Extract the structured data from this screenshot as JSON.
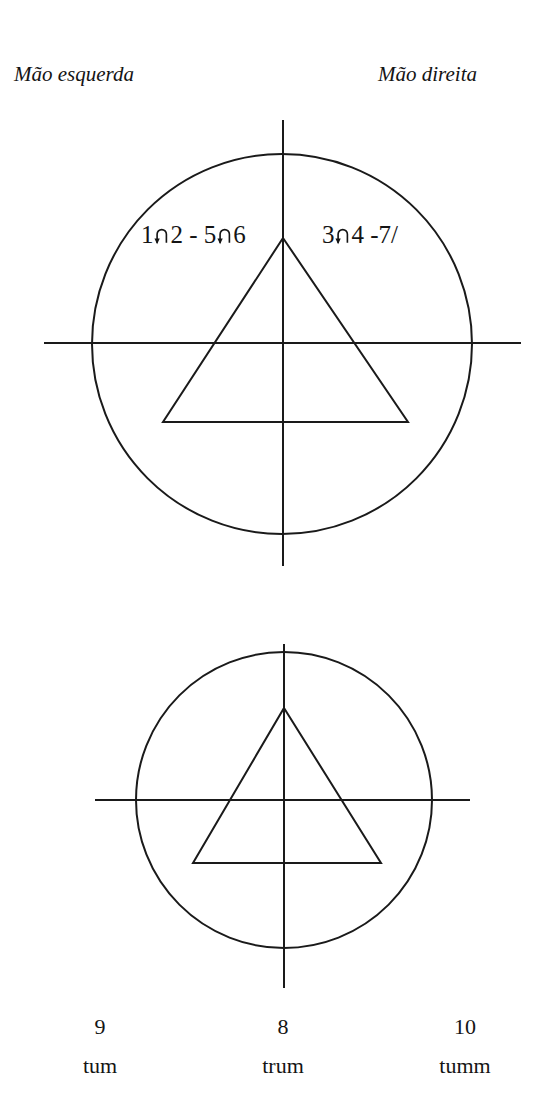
{
  "headers": {
    "left": "Mão esquerda",
    "right": "Mão direita"
  },
  "annotations": {
    "left_before": "1",
    "left_middle": "2 - 5",
    "left_after": "6",
    "right_before": "3",
    "right_after": "4 -7/",
    "arc_arrow_icon": "arc-arrow-down-icon",
    "full_left_text": "1 ∩ 2 - 5∩6",
    "full_right_text": "3∩4 -7/"
  },
  "figures": [
    {
      "name": "top-figure",
      "circle": {
        "cx": 282,
        "cy": 344,
        "r": 190
      },
      "h_axis": {
        "x1": 44,
        "y1": 343,
        "x2": 521,
        "y2": 343
      },
      "v_axis": {
        "x1": 283,
        "y1": 120,
        "x2": 283,
        "y2": 566
      },
      "triangle": {
        "apex_x": 283,
        "apex_y": 238,
        "base_y": 422,
        "base_left_x": 163,
        "base_right_x": 408
      }
    },
    {
      "name": "bottom-figure",
      "circle": {
        "cx": 284,
        "cy": 800,
        "r": 148
      },
      "h_axis": {
        "x1": 95,
        "y1": 800,
        "x2": 470,
        "y2": 800
      },
      "v_axis": {
        "x1": 284,
        "y1": 644,
        "x2": 284,
        "y2": 988
      },
      "triangle": {
        "apex_x": 284,
        "apex_y": 708,
        "base_y": 863,
        "base_left_x": 193,
        "base_right_x": 381
      }
    }
  ],
  "syllables": [
    {
      "number": "9",
      "word": "tum"
    },
    {
      "number": "8",
      "word": "trum"
    },
    {
      "number": "10",
      "word": "tumm"
    }
  ],
  "colors": {
    "ink": "#1a1a1a",
    "text": "#141414",
    "background": "#ffffff"
  }
}
